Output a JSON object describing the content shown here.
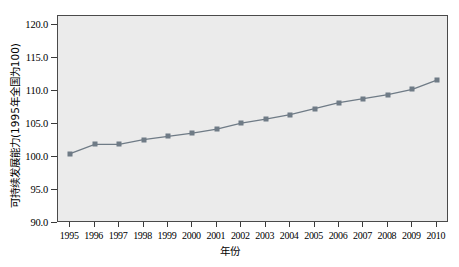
{
  "chart_data": {
    "type": "line",
    "title": "",
    "xlabel": "年份",
    "ylabel": "可持续发展能力(1995年全国为100)",
    "categories": [
      "1995",
      "1996",
      "1997",
      "1998",
      "1999",
      "2000",
      "2001",
      "2002",
      "2003",
      "2004",
      "2005",
      "2006",
      "2007",
      "2008",
      "2009",
      "2010"
    ],
    "x": [
      1995,
      1996,
      1997,
      1998,
      1999,
      2000,
      2001,
      2002,
      2003,
      2004,
      2005,
      2006,
      2007,
      2008,
      2009,
      2010
    ],
    "values": [
      100.5,
      101.9,
      101.9,
      102.6,
      103.1,
      103.6,
      104.2,
      105.1,
      105.7,
      106.4,
      107.3,
      108.2,
      108.8,
      109.4,
      110.2,
      111.6
    ],
    "series": [
      {
        "name": "可持续发展能力",
        "values": [
          100.5,
          101.9,
          101.9,
          102.6,
          103.1,
          103.6,
          104.2,
          105.1,
          105.7,
          106.4,
          107.3,
          108.2,
          108.8,
          109.4,
          110.2,
          111.6
        ]
      }
    ],
    "ylim": [
      90.0,
      121.3
    ],
    "ytick_labels": [
      "120.0",
      "115.0",
      "110.0",
      "105.0",
      "100.0",
      "95.0",
      "90.0"
    ],
    "ytick_values": [
      120.0,
      115.0,
      110.0,
      105.0,
      100.0,
      95.0,
      90.0
    ],
    "grid": false,
    "legend": null,
    "legend_position": "none",
    "colors": {
      "marker": "#6f7b86",
      "line": "#6f7b86",
      "plot_background": "#ebebeb",
      "frame": "#4a4a4a",
      "page_background": "#ffffff",
      "text": "#000000"
    }
  }
}
